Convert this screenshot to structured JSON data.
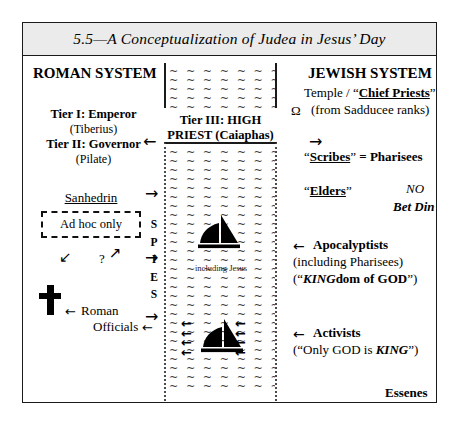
{
  "figure": {
    "title": "5.5—A Conceptualization of Judea in Jesus’ Day"
  },
  "roman": {
    "heading": "ROMAN SYSTEM",
    "tier1": "Tier I: Emperor",
    "tier1_name": "(Tiberius)",
    "tier2": "Tier II: Governor",
    "tier2_name": "(Pilate)",
    "sanhedrin": "Sanhedrin",
    "adhoc": "Ad hoc only",
    "question": "?",
    "officials_line1": "Roman",
    "officials_line2": "Officials",
    "spies": "SPIES"
  },
  "center": {
    "tier3_line1": "Tier III:  HIGH",
    "tier3_line2": "PRIEST (Caiaphas)",
    "including_jesus": "including Jesus",
    "water_mark": "~",
    "boat_icon": "sailboat-icon",
    "cross_icon": "cross-icon"
  },
  "jewish": {
    "heading": "JEWISH SYSTEM",
    "temple_prefix": "Temple / ",
    "chief_priests": "Chief Priests",
    "omega": "Ω",
    "sadducee": "(from Sadducee ranks)",
    "scribes": "Scribes",
    "scribes_suffix": " = Pharisees",
    "elders": "Elders",
    "no": "NO",
    "bet_din": "Bet Din",
    "apocalyptists": "Apocalyptists",
    "apoc_sub1": "(including Pharisees)",
    "apoc_king": "KING",
    "apoc_king_rest": "dom of GOD",
    "activists": "Activists",
    "activists_pre": "(“Only GOD is ",
    "activists_king": "KING",
    "activists_post": "”)",
    "essenes": "Essenes"
  },
  "arrows": {
    "left": "←",
    "right": "→",
    "down_left": "↙",
    "up_right": "↗"
  },
  "colors": {
    "frame": "#1a1a1a",
    "title_band": "#ebebeb",
    "ink": "#000000",
    "water": "#3b3b3b"
  }
}
